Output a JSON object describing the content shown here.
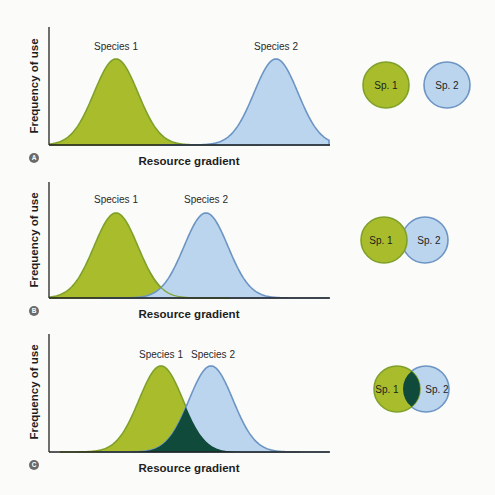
{
  "figure": {
    "panels": [
      {
        "id": "A",
        "y_axis_label": "Frequency of use",
        "x_axis_label": "Resource gradient",
        "species": [
          {
            "name": "Species 1",
            "short": "Sp. 1",
            "color": "#a9bd2c"
          },
          {
            "name": "Species 2",
            "short": "Sp. 2",
            "color": "#bcd5ee"
          }
        ],
        "overlap": "none"
      },
      {
        "id": "B",
        "y_axis_label": "Frequency of use",
        "x_axis_label": "Resource gradient",
        "species": [
          {
            "name": "Species 1",
            "short": "Sp. 1",
            "color": "#a9bd2c"
          },
          {
            "name": "Species 2",
            "short": "Sp. 2",
            "color": "#bcd5ee"
          }
        ],
        "overlap": "slight"
      },
      {
        "id": "C",
        "y_axis_label": "Frequency of use",
        "x_axis_label": "Resource gradient",
        "species": [
          {
            "name": "Species 1",
            "short": "Sp. 1",
            "color": "#a9bd2c"
          },
          {
            "name": "Species 2",
            "short": "Sp. 2",
            "color": "#bcd5ee"
          }
        ],
        "overlap": "substantial",
        "overlap_color": "#0f4a3a"
      }
    ],
    "colors": {
      "species1_fill": "#a9bd2c",
      "species1_stroke": "#7fa12a",
      "species2_fill": "#bcd5ee",
      "species2_stroke": "#6c95c4",
      "overlap_fill": "#0f4a3a",
      "axis": "#222222",
      "badge": "#6b6b6b"
    }
  }
}
